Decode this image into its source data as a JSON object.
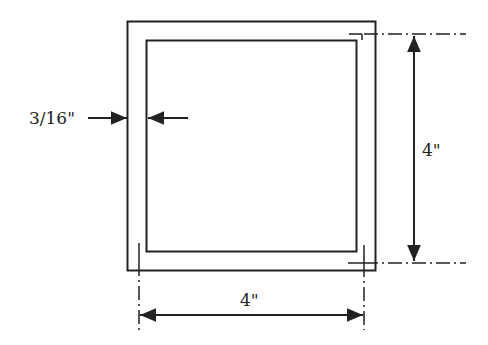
{
  "diagram": {
    "labels": {
      "wall_thickness": "3/16\"",
      "height": "4\"",
      "width": "4\""
    },
    "colors": {
      "stroke": "#222222",
      "background": "#ffffff"
    }
  }
}
